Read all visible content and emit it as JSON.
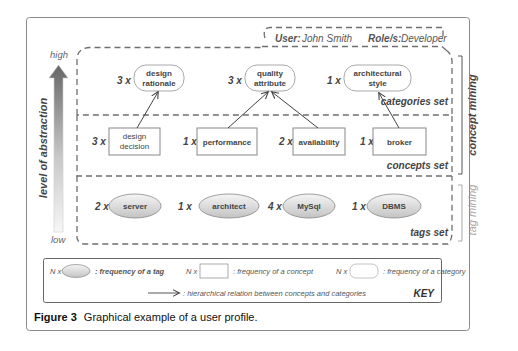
{
  "user_box": {
    "user_label": "User:",
    "user_name": "John Smith",
    "role_label": "Role/s:",
    "role_name": "Developer"
  },
  "axis": {
    "high": "high",
    "low": "low",
    "title": "level of abstraction"
  },
  "side_labels": {
    "concept_mining": "concept mining",
    "tag_mining": "tag mining"
  },
  "sets": {
    "categories": {
      "label": "categories set",
      "items": [
        {
          "count": "3 x",
          "line1": "design",
          "line2": "rationale"
        },
        {
          "count": "3 x",
          "line1": "quality",
          "line2": "attribute"
        },
        {
          "count": "1 x",
          "line1": "architectural",
          "line2": "style"
        }
      ]
    },
    "concepts": {
      "label": "concepts set",
      "items": [
        {
          "count": "3 x",
          "line1": "design",
          "line2": "decision"
        },
        {
          "count": "1 x",
          "line1": "performance",
          "line2": ""
        },
        {
          "count": "2 x",
          "line1": "availability",
          "line2": ""
        },
        {
          "count": "1 x",
          "line1": "broker",
          "line2": ""
        }
      ]
    },
    "tags": {
      "label": "tags set",
      "items": [
        {
          "count": "2 x",
          "label": "server"
        },
        {
          "count": "1 x",
          "label": "architect"
        },
        {
          "count": "4 x",
          "label": "MySql"
        },
        {
          "count": "1 x",
          "label": "DBMS"
        }
      ]
    }
  },
  "relations": [
    {
      "from": "design decision",
      "to": "design rationale"
    },
    {
      "from": "performance",
      "to": "quality attribute"
    },
    {
      "from": "availability",
      "to": "quality attribute"
    },
    {
      "from": "broker",
      "to": "architectural style"
    }
  ],
  "key": {
    "title": "KEY",
    "tag_prefix": "N x",
    "tag_desc": ": frequency of a tag",
    "concept_prefix": "N x",
    "concept_desc": ": frequency of a concept",
    "category_prefix": "N x",
    "category_desc": ": frequency of a category",
    "arrow_desc": ": hierarchical relation between concepts and categories"
  },
  "caption": {
    "label": "Figure 3",
    "text": "Graphical example of a user profile."
  },
  "colors": {
    "frame_border": "#8a8a8a",
    "dash": "#6f6f6f",
    "text": "#333333",
    "light_text": "#9a9a9a",
    "ellipse_fill_top": "#f2f2f2",
    "ellipse_fill_bottom": "#c9c9c9"
  }
}
